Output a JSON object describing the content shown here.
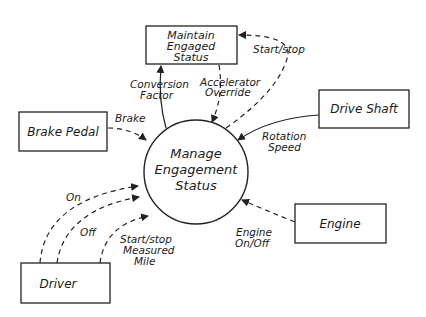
{
  "diagram": {
    "type": "data-flow-diagram",
    "process": {
      "lines": [
        "Manage",
        "Engagement",
        "Status"
      ]
    },
    "stores": {
      "maintain": {
        "lines": [
          "Maintain",
          "Engaged",
          "Status"
        ]
      }
    },
    "entities": {
      "brake_pedal": "Brake Pedal",
      "drive_shaft": "Drive Shaft",
      "engine": "Engine",
      "driver": "Driver"
    },
    "flows": {
      "brake": "Brake",
      "conversion_factor": [
        "Conversion",
        "Factor"
      ],
      "accelerator_override": [
        "Accelerator",
        "Override"
      ],
      "start_stop_top": "Start/stop",
      "rotation_speed": [
        "Rotation",
        "Speed"
      ],
      "engine_on_off": [
        "Engine",
        "On/Off"
      ],
      "on": "On",
      "off": "Off",
      "start_stop_measured_mile": [
        "Start/stop",
        "Measured",
        "Mile"
      ]
    }
  }
}
